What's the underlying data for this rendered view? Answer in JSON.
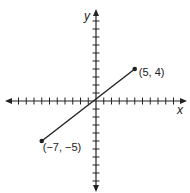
{
  "chart_data": {
    "type": "line",
    "title": "",
    "xlabel": "x",
    "ylabel": "y",
    "xlim": [
      -11,
      11
    ],
    "ylim": [
      -11,
      11
    ],
    "grid": false,
    "tick_spacing": 1,
    "series": [
      {
        "name": "segment",
        "x": [
          -7,
          5
        ],
        "y": [
          -5,
          4
        ],
        "endpoints_marked": true
      }
    ],
    "annotations": [
      {
        "text": "(5, 4)",
        "x": 5,
        "y": 4
      },
      {
        "text": "(−7, −5)",
        "x": -7,
        "y": -5
      }
    ],
    "colors": {
      "line": "#222222",
      "axis": "#222222"
    }
  },
  "labels": {
    "x_axis": "x",
    "y_axis": "y",
    "point_a": "(5, 4)",
    "point_b": "(−7, −5)"
  }
}
